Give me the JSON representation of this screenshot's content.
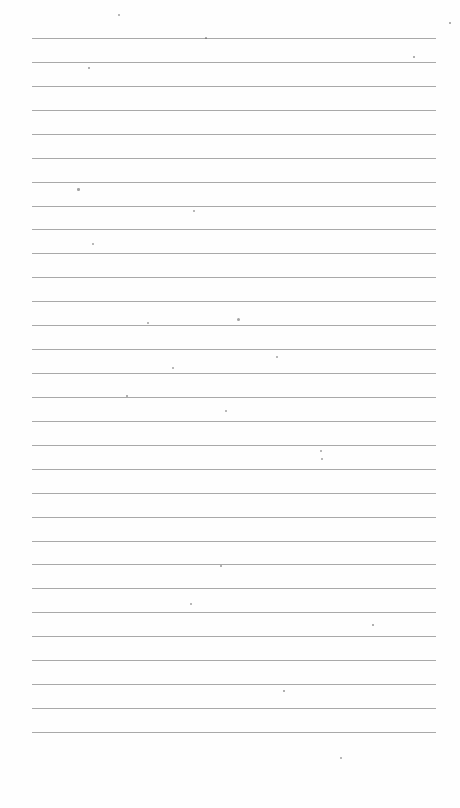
{
  "paper": {
    "type": "lined-notebook-page",
    "background": "#fefefe",
    "line_color": "#a9a9a9",
    "line_count": 30,
    "first_line_y": 38,
    "line_spacing": 23.93,
    "line_left": 32,
    "line_width": 404
  },
  "specks": [
    [
      118,
      14,
      2
    ],
    [
      205,
      37,
      1.5
    ],
    [
      77,
      188,
      2.5
    ],
    [
      193,
      210,
      2
    ],
    [
      92,
      243,
      2
    ],
    [
      237,
      318,
      3
    ],
    [
      147,
      322,
      2
    ],
    [
      276,
      356,
      2
    ],
    [
      172,
      367,
      2
    ],
    [
      126,
      395,
      1.5
    ],
    [
      225,
      410,
      2
    ],
    [
      320,
      450,
      2
    ],
    [
      321,
      458,
      2
    ],
    [
      220,
      565,
      1.5
    ],
    [
      190,
      603,
      2
    ],
    [
      372,
      624,
      1.5
    ],
    [
      283,
      690,
      1.5
    ],
    [
      340,
      757,
      2
    ],
    [
      413,
      56,
      1.5
    ],
    [
      449,
      22,
      1.5
    ],
    [
      88,
      67,
      1.5
    ]
  ]
}
